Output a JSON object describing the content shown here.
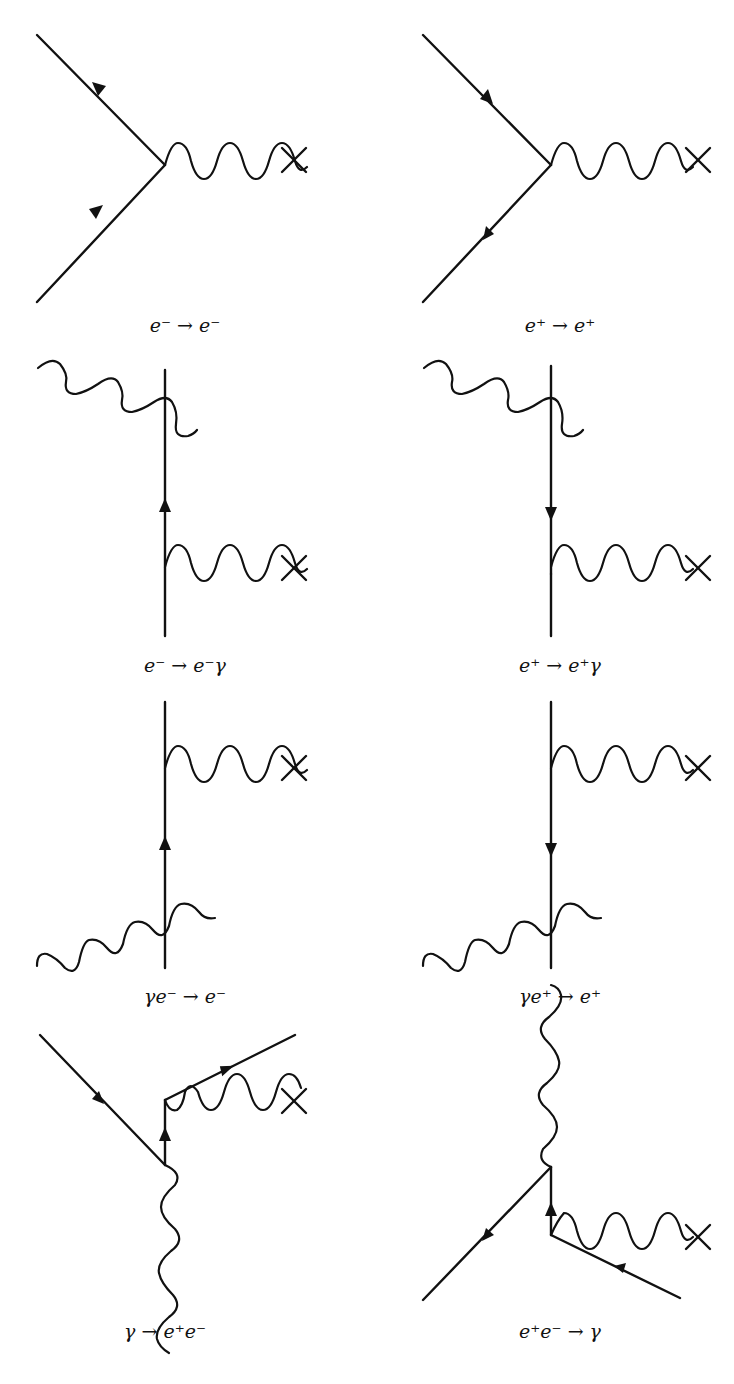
{
  "page": {
    "header_fragment": ""
  },
  "diagrams": [
    {
      "id": "d1",
      "caption": "e⁻ → e⁻"
    },
    {
      "id": "d2",
      "caption": "e⁺ → e⁺"
    },
    {
      "id": "d3",
      "caption": "e⁻ → e⁻γ"
    },
    {
      "id": "d4",
      "caption": "e⁺ → e⁺γ"
    },
    {
      "id": "d5",
      "caption": "γe⁻ → e⁻"
    },
    {
      "id": "d6",
      "caption": "γe⁺ → e⁺"
    },
    {
      "id": "d7",
      "caption": "γ → e⁺e⁻"
    },
    {
      "id": "d8",
      "caption": "e⁺e⁻ → γ"
    }
  ],
  "colors": {
    "ink": "#111111",
    "background": "#ffffff"
  }
}
